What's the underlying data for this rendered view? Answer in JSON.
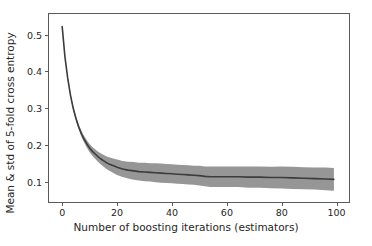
{
  "figure": {
    "background_color": "#ffffff",
    "axes_frame_color": "#5a5a5a",
    "text_color": "#262626"
  },
  "chart_data": {
    "type": "line",
    "title": "",
    "subtitle": "",
    "xlabel": "Number of boosting iterations (estimators)",
    "ylabel": "Mean & std of 5-fold cross entropy",
    "xlim": [
      -4.8,
      104.5
    ],
    "ylim": [
      0.0443,
      0.5559
    ],
    "xticks": [
      0,
      20,
      40,
      60,
      80,
      100
    ],
    "xtick_labels": [
      "0",
      "20",
      "40",
      "60",
      "80",
      "100"
    ],
    "yticks": [
      0.1,
      0.2,
      0.3,
      0.4,
      0.5
    ],
    "ytick_labels": [
      "0.1",
      "0.2",
      "0.3",
      "0.4",
      "0.5"
    ],
    "grid": false,
    "legend": null,
    "legend_position": "none",
    "annotations": [],
    "line_color": "#3c3c3c",
    "band_color": "#969696",
    "band_opacity": 1.0,
    "line_width": 1.6,
    "series": [
      {
        "name": "Mean 5-fold cross entropy",
        "kind": "line",
        "x": [
          0,
          1,
          2,
          3,
          4,
          5,
          6,
          7,
          8,
          9,
          10,
          11,
          12,
          13,
          14,
          15,
          16,
          17,
          18,
          19,
          20,
          22,
          24,
          26,
          28,
          30,
          32,
          34,
          36,
          38,
          40,
          42,
          44,
          46,
          48,
          50,
          52,
          54,
          56,
          58,
          60,
          64,
          68,
          72,
          76,
          80,
          84,
          88,
          92,
          96,
          99
        ],
        "values": [
          0.522,
          0.44,
          0.382,
          0.336,
          0.3,
          0.272,
          0.249,
          0.23,
          0.215,
          0.202,
          0.191,
          0.182,
          0.175,
          0.168,
          0.162,
          0.157,
          0.152,
          0.148,
          0.145,
          0.142,
          0.139,
          0.134,
          0.131,
          0.129,
          0.127,
          0.126,
          0.125,
          0.124,
          0.123,
          0.122,
          0.121,
          0.12,
          0.119,
          0.118,
          0.117,
          0.116,
          0.114,
          0.113,
          0.113,
          0.113,
          0.113,
          0.113,
          0.112,
          0.112,
          0.111,
          0.111,
          0.11,
          0.109,
          0.108,
          0.107,
          0.106
        ]
      },
      {
        "name": "Std band (mean ± std)",
        "kind": "band",
        "x": [
          0,
          1,
          2,
          3,
          4,
          5,
          6,
          7,
          8,
          9,
          10,
          11,
          12,
          13,
          14,
          15,
          16,
          17,
          18,
          19,
          20,
          22,
          24,
          26,
          28,
          30,
          32,
          34,
          36,
          38,
          40,
          42,
          44,
          46,
          48,
          50,
          52,
          54,
          56,
          58,
          60,
          64,
          68,
          72,
          76,
          80,
          84,
          88,
          92,
          96,
          99
        ],
        "std": [
          0.001,
          0.002,
          0.003,
          0.004,
          0.005,
          0.006,
          0.007,
          0.008,
          0.009,
          0.01,
          0.011,
          0.012,
          0.013,
          0.014,
          0.015,
          0.016,
          0.017,
          0.018,
          0.019,
          0.02,
          0.021,
          0.022,
          0.023,
          0.024,
          0.024,
          0.025,
          0.025,
          0.026,
          0.026,
          0.026,
          0.026,
          0.026,
          0.026,
          0.026,
          0.026,
          0.027,
          0.027,
          0.028,
          0.028,
          0.028,
          0.028,
          0.028,
          0.029,
          0.029,
          0.029,
          0.03,
          0.03,
          0.03,
          0.03,
          0.031,
          0.031
        ]
      }
    ]
  }
}
